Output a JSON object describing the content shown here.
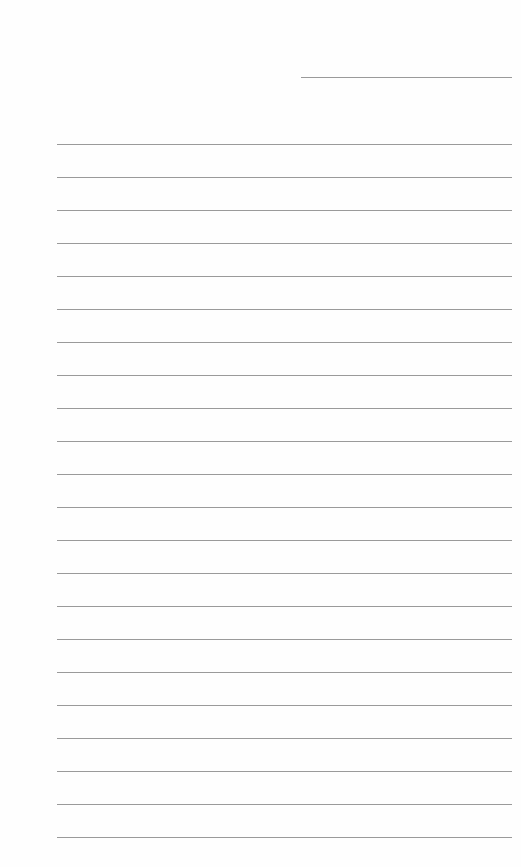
{
  "document": {
    "type": "lined-paper",
    "header_line": {
      "present": true
    },
    "ruled_lines": {
      "count": 22,
      "first_y": 144,
      "spacing": 33
    }
  },
  "colors": {
    "paper": "#fefefe",
    "line": "#9a9a9a"
  }
}
